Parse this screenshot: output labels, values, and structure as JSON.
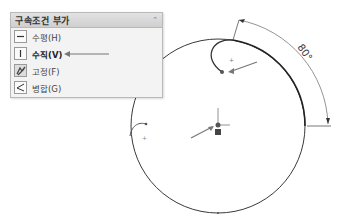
{
  "panel": {
    "title": "구속조건 부가",
    "collapse_icon": "double-chevron-up-icon",
    "items": [
      {
        "label": "수평(H)",
        "icon": "horizontal-icon"
      },
      {
        "label": "수직(V)",
        "icon": "vertical-icon",
        "highlighted": true
      },
      {
        "label": "고정(F)",
        "icon": "fix-icon"
      },
      {
        "label": "병합(G)",
        "icon": "merge-icon"
      }
    ]
  },
  "sketch": {
    "dimension_label": "80°",
    "circle": {
      "cx": 218,
      "cy": 126,
      "r": 87
    },
    "colors": {
      "line": "#333333",
      "dimension": "#666666",
      "arrow": "#777777"
    }
  }
}
